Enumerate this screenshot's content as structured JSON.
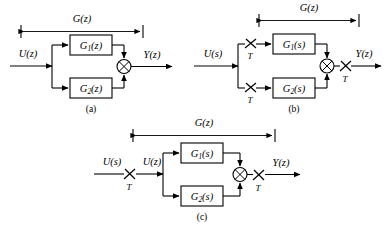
{
  "figure": {
    "background_color": "#ffffff",
    "line_color": "#000000",
    "diagrams": [
      {
        "id": "a",
        "caption": "(a)",
        "input_label": "U(z)",
        "output_label": "Y(z)",
        "span_label": "G(z)",
        "blocks": [
          {
            "name": "G1",
            "label_main": "G",
            "label_sub": "1",
            "label_arg": "(z)"
          },
          {
            "name": "G2",
            "label_main": "G",
            "label_sub": "2",
            "label_arg": "(z)"
          }
        ],
        "samplers": [],
        "summing_junction": "crossed-circle"
      },
      {
        "id": "b",
        "caption": "(b)",
        "input_label": "U(s)",
        "output_label": "Y(z)",
        "span_label": "G(z)",
        "blocks": [
          {
            "name": "G1",
            "label_main": "G",
            "label_sub": "1",
            "label_arg": "(s)"
          },
          {
            "name": "G2",
            "label_main": "G",
            "label_sub": "2",
            "label_arg": "(s)"
          }
        ],
        "samplers": [
          {
            "name": "sampler-top",
            "period_label": "T"
          },
          {
            "name": "sampler-bottom",
            "period_label": "T"
          },
          {
            "name": "sampler-output",
            "period_label": "T"
          }
        ],
        "summing_junction": "crossed-circle"
      },
      {
        "id": "c",
        "caption": "(c)",
        "input_label": "U(s)",
        "intermediate_label": "U(z)",
        "output_label": "Y(z)",
        "span_label": "G(z)",
        "blocks": [
          {
            "name": "G1",
            "label_main": "G",
            "label_sub": "1",
            "label_arg": "(s)"
          },
          {
            "name": "G2",
            "label_main": "G",
            "label_sub": "2",
            "label_arg": "(s)"
          }
        ],
        "samplers": [
          {
            "name": "sampler-input",
            "period_label": "T"
          },
          {
            "name": "sampler-output",
            "period_label": "T"
          }
        ],
        "summing_junction": "crossed-circle"
      }
    ]
  }
}
